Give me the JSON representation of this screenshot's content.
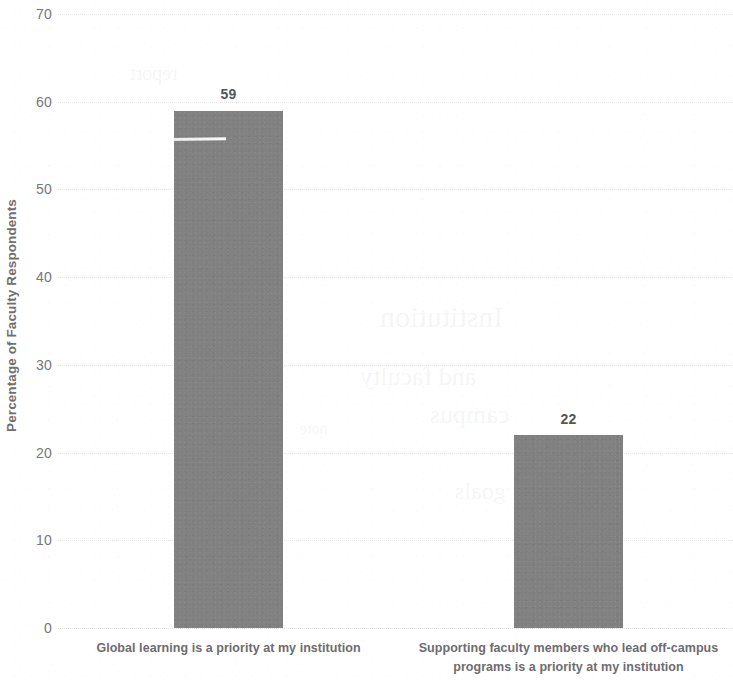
{
  "chart_data": {
    "type": "bar",
    "title": "",
    "xlabel": "",
    "ylabel": "Percentage of Faculty Respondents",
    "categories": [
      "Global learning is a priority at my institution",
      "Supporting faculty members who lead off-campus programs is a priority at my institution"
    ],
    "category_lines": [
      [
        "Global learning is a priority at my institution"
      ],
      [
        "Supporting faculty members who lead off-campus",
        "programs is a priority at my institution"
      ]
    ],
    "values": [
      59,
      22
    ],
    "data_labels": [
      "59",
      "22"
    ],
    "ylim": [
      0,
      70
    ],
    "ytick_values": [
      70,
      60,
      50,
      40,
      30,
      20,
      10,
      0
    ],
    "ytick_labels": [
      "70",
      "60",
      "50",
      "40",
      "30",
      "20",
      "10",
      "0"
    ],
    "grid": true,
    "grid_axis": "y",
    "legend": false,
    "legend_position": "none",
    "bar_color": "#808080",
    "grid_color": "#e2e0e0",
    "label_color": "#77767a",
    "axis_title_color": "#6f6f6f"
  },
  "artifacts": {
    "ghost_text": [
      "Institution",
      "and faculty",
      "campus",
      "goals",
      "report",
      "note"
    ]
  }
}
